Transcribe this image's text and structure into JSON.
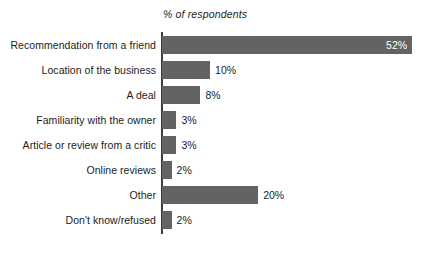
{
  "chart_data": {
    "type": "bar",
    "orientation": "horizontal",
    "title": "",
    "subtitle": "",
    "xlabel": "% of respondents",
    "ylabel": "",
    "axis_title": "% of respondents",
    "grid": false,
    "legend": null,
    "xlim": [
      0,
      52
    ],
    "unit": "%",
    "bar_color": "#636363",
    "inside_label_color": "#ffffff",
    "outside_label_color": "#1c1c1c",
    "background_color": "#ffffff",
    "axis_line_color": "#3b3b3b",
    "categories": [
      "Recommendation from a friend",
      "Location of the business",
      "A deal",
      "Familiarity with the owner",
      "Article or review from a critic",
      "Online reviews",
      "Other",
      "Don't know/refused"
    ],
    "values": [
      52,
      10,
      8,
      3,
      3,
      2,
      20,
      2
    ],
    "value_labels": [
      "52%",
      "10%",
      "8%",
      "3%",
      "3%",
      "2%",
      "20%",
      "2%"
    ],
    "label_placement": [
      "inside",
      "outside",
      "outside",
      "outside",
      "outside",
      "outside",
      "outside",
      "outside"
    ],
    "bars": [
      {
        "category": "Recommendation from a friend",
        "value": 52,
        "label": "52%",
        "placement": "inside"
      },
      {
        "category": "Location of the business",
        "value": 10,
        "label": "10%",
        "placement": "outside"
      },
      {
        "category": "A deal",
        "value": 8,
        "label": "8%",
        "placement": "outside"
      },
      {
        "category": "Familiarity with the owner",
        "value": 3,
        "label": "3%",
        "placement": "outside"
      },
      {
        "category": "Article or review from a critic",
        "value": 3,
        "label": "3%",
        "placement": "outside"
      },
      {
        "category": "Online reviews",
        "value": 2,
        "label": "2%",
        "placement": "outside"
      },
      {
        "category": "Other",
        "value": 20,
        "label": "20%",
        "placement": "outside"
      },
      {
        "category": "Don't know/refused",
        "value": 2,
        "label": "2%",
        "placement": "outside"
      }
    ]
  }
}
